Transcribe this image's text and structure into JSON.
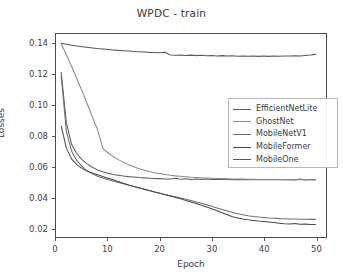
{
  "chart_data": {
    "type": "line",
    "title": "WPDC - train",
    "xlabel": "Epoch",
    "ylabel": "Losses",
    "xlim": [
      0,
      52
    ],
    "ylim": [
      0.014,
      0.1465
    ],
    "grid": false,
    "legend_position": "center-right",
    "xticks": [
      0,
      10,
      20,
      30,
      40,
      50
    ],
    "xtick_labels": [
      "0",
      "10",
      "20",
      "30",
      "40",
      "50"
    ],
    "yticks": [
      0.02,
      0.04,
      0.06,
      0.08,
      0.1,
      0.12,
      0.14
    ],
    "ytick_labels": [
      "0.02",
      "0.04",
      "0.06",
      "0.08",
      "0.10",
      "0.12",
      "0.14"
    ],
    "x": [
      1,
      2,
      3,
      4,
      5,
      6,
      7,
      8,
      9,
      10,
      11,
      12,
      13,
      14,
      15,
      16,
      17,
      18,
      19,
      20,
      21,
      22,
      23,
      24,
      25,
      26,
      27,
      28,
      29,
      30,
      31,
      32,
      33,
      34,
      35,
      36,
      37,
      38,
      39,
      40,
      41,
      42,
      43,
      44,
      45,
      46,
      47,
      48,
      49,
      50
    ],
    "series": [
      {
        "name": "EfficientNetLite",
        "color": "#5f5f5f",
        "values": [
          0.1215,
          0.0885,
          0.0745,
          0.0685,
          0.0645,
          0.0617,
          0.0595,
          0.0578,
          0.0566,
          0.0556,
          0.0548,
          0.0543,
          0.0538,
          0.0534,
          0.0531,
          0.0528,
          0.0526,
          0.0524,
          0.0522,
          0.0521,
          0.0519,
          0.0518,
          0.0523,
          0.0517,
          0.052,
          0.0516,
          0.0519,
          0.0516,
          0.0518,
          0.0515,
          0.0517,
          0.0515,
          0.0516,
          0.0514,
          0.0516,
          0.0514,
          0.0515,
          0.0514,
          0.0515,
          0.0513,
          0.0515,
          0.0513,
          0.0514,
          0.0513,
          0.0514,
          0.0512,
          0.0519,
          0.0512,
          0.0516,
          0.0513
        ]
      },
      {
        "name": "GhostNet",
        "color": "#8a8a8a",
        "values": [
          0.1402,
          0.133,
          0.1255,
          0.1175,
          0.1095,
          0.101,
          0.0925,
          0.084,
          0.072,
          0.069,
          0.0665,
          0.0645,
          0.0627,
          0.0612,
          0.0598,
          0.0586,
          0.0576,
          0.0567,
          0.056,
          0.0554,
          0.0548,
          0.0543,
          0.0539,
          0.0536,
          0.0533,
          0.053,
          0.0528,
          0.0526,
          0.0525,
          0.0523,
          0.0522,
          0.0521,
          0.052,
          0.0519,
          0.0518,
          0.0518,
          0.0517,
          0.0517,
          0.0516,
          0.0516,
          0.0515,
          0.0515,
          0.0515,
          0.0514,
          0.0514,
          0.0514,
          0.0513,
          0.0513,
          0.0513,
          0.0512
        ]
      },
      {
        "name": "MobileNetV1",
        "color": "#6e6e6e",
        "values": [
          0.119,
          0.083,
          0.07,
          0.064,
          0.06,
          0.0572,
          0.0552,
          0.0537,
          0.0525,
          0.0515,
          0.0505,
          0.0496,
          0.0487,
          0.0478,
          0.0469,
          0.046,
          0.0451,
          0.0442,
          0.0434,
          0.0426,
          0.0418,
          0.041,
          0.0402,
          0.0394,
          0.0386,
          0.0378,
          0.0369,
          0.036,
          0.035,
          0.034,
          0.033,
          0.032,
          0.031,
          0.03,
          0.0292,
          0.0285,
          0.0279,
          0.0274,
          0.027,
          0.0267,
          0.0264,
          0.0262,
          0.026,
          0.0259,
          0.0258,
          0.0257,
          0.0256,
          0.0256,
          0.0255,
          0.0255
        ]
      },
      {
        "name": "MobileFormer",
        "color": "#4b4b4b",
        "values": [
          0.0865,
          0.072,
          0.065,
          0.0612,
          0.0588,
          0.057,
          0.0557,
          0.0546,
          0.0535,
          0.0524,
          0.0513,
          0.0502,
          0.0491,
          0.048,
          0.047,
          0.0461,
          0.0452,
          0.0443,
          0.0434,
          0.0425,
          0.0416,
          0.0407,
          0.0398,
          0.0389,
          0.0379,
          0.0369,
          0.0358,
          0.0347,
          0.0336,
          0.0325,
          0.0312,
          0.0298,
          0.0285,
          0.0272,
          0.0264,
          0.0257,
          0.0252,
          0.0248,
          0.0244,
          0.0241,
          0.0238,
          0.0234,
          0.023,
          0.0227,
          0.0225,
          0.0228,
          0.0223,
          0.0224,
          0.0222,
          0.0222
        ]
      },
      {
        "name": "MobileOne",
        "color": "#585858",
        "values": [
          0.1405,
          0.1398,
          0.1392,
          0.1386,
          0.1382,
          0.1378,
          0.1374,
          0.137,
          0.1367,
          0.1364,
          0.1361,
          0.1358,
          0.1356,
          0.1354,
          0.1351,
          0.1349,
          0.1347,
          0.1345,
          0.1344,
          0.1342,
          0.1346,
          0.1328,
          0.1326,
          0.1327,
          0.1325,
          0.1327,
          0.1324,
          0.1326,
          0.1323,
          0.1325,
          0.1322,
          0.1324,
          0.1321,
          0.1323,
          0.132,
          0.1322,
          0.132,
          0.1322,
          0.1319,
          0.1321,
          0.1319,
          0.1321,
          0.132,
          0.1322,
          0.1321,
          0.1323,
          0.1322,
          0.1325,
          0.1328,
          0.1332
        ]
      }
    ]
  }
}
